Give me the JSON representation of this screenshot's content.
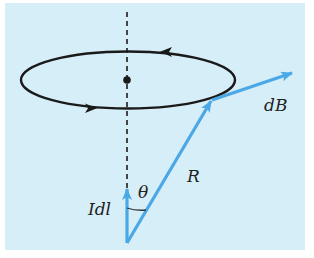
{
  "diagram": {
    "type": "physics-biot-savart",
    "background_color": "#d6eef8",
    "loop_color": "#1a1a1a",
    "vector_color": "#4aa8e6",
    "labels": {
      "dB": "dB",
      "R": "R",
      "Idl": "Idl",
      "theta": "θ"
    },
    "elements": [
      "current-loop (ellipse, counterclockwise arrows)",
      "dashed-axis",
      "center-point",
      "Idl-vector",
      "R-vector",
      "dB-vector",
      "theta-angle-arc"
    ]
  }
}
